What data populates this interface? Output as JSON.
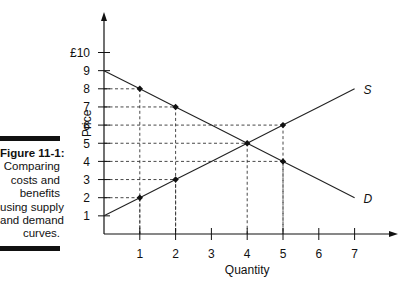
{
  "caption": {
    "figure_label": "Figure 11-1:",
    "lines": [
      "Comparing",
      "costs and",
      "benefits",
      "using supply",
      "and demand",
      "curves."
    ]
  },
  "chart_data": {
    "type": "line",
    "title": "Comparing costs and benefits using supply and demand curves",
    "xlabel": "Quantity",
    "ylabel": "Price",
    "x_ticks": [
      "1",
      "2",
      "3",
      "4",
      "5",
      "6",
      "7"
    ],
    "y_ticks": [
      "1",
      "2",
      "3",
      "4",
      "5",
      "6",
      "7",
      "8",
      "9",
      "£10"
    ],
    "xlim": [
      0,
      7
    ],
    "ylim": [
      0,
      10
    ],
    "grid": false,
    "series": [
      {
        "name": "S",
        "points": [
          [
            0,
            1
          ],
          [
            1,
            2
          ],
          [
            2,
            3
          ],
          [
            3,
            4
          ],
          [
            4,
            5
          ],
          [
            5,
            6
          ],
          [
            6,
            7
          ],
          [
            7,
            8
          ]
        ]
      },
      {
        "name": "D",
        "points": [
          [
            0,
            9
          ],
          [
            1,
            8
          ],
          [
            2,
            7
          ],
          [
            3,
            6
          ],
          [
            4,
            5
          ],
          [
            5,
            4
          ],
          [
            6,
            3
          ],
          [
            7,
            2
          ]
        ]
      }
    ],
    "marked_points": [
      [
        1,
        8
      ],
      [
        2,
        7
      ],
      [
        4,
        5
      ],
      [
        5,
        6
      ],
      [
        5,
        4
      ],
      [
        1,
        2
      ],
      [
        2,
        3
      ]
    ],
    "dashed_guides": [
      {
        "x": 1,
        "y": 8
      },
      {
        "x": 2,
        "y": 7
      },
      {
        "x": 5,
        "y": 6
      },
      {
        "x": 4,
        "y": 5
      },
      {
        "x": 5,
        "y": 4
      },
      {
        "x": 2,
        "y": 3
      },
      {
        "x": 1,
        "y": 2
      }
    ],
    "annotations": [
      "S",
      "D"
    ]
  }
}
